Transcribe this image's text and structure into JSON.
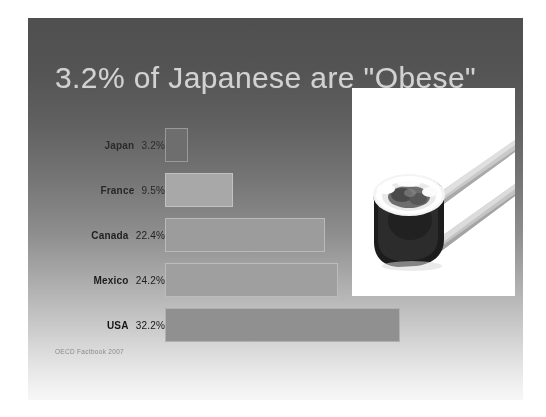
{
  "slide": {
    "title": "3.2% of Japanese are \"Obese\"",
    "source_note": "OECD Factbook 2007",
    "title_color": "#d2d2d2",
    "background_top_color": "#4f4f4f",
    "background_bottom_color": "#f7f7f7"
  },
  "photo": {
    "alt_name": "sushi-roll-chopsticks-photo",
    "background_color": "#ffffff"
  },
  "chart_data": {
    "type": "bar",
    "orientation": "horizontal",
    "title": "3.2% of Japanese are \"Obese\"",
    "xlabel": "",
    "ylabel": "",
    "categories": [
      "Japan",
      "France",
      "Canada",
      "Mexico",
      "USA"
    ],
    "values": [
      3.2,
      9.5,
      22.4,
      24.2,
      32.2
    ],
    "value_labels": [
      "3.2%",
      "9.5%",
      "22.4%",
      "24.2%",
      "32.2%"
    ],
    "unit": "%",
    "xlim": [
      0,
      32.2
    ],
    "grid": false,
    "legend": false,
    "source": "OECD Factbook 2007",
    "bar_colors": [
      "#6e6e6e",
      "#a6a6a6",
      "#9a9a9a",
      "#9e9e9e",
      "#8f8f8f"
    ],
    "label_colors": [
      "#2a2a2a",
      "#2a2a2a",
      "#1f1f1f",
      "#1f1f1f",
      "#1a1a1a"
    ]
  },
  "rows": [
    {
      "country": "Japan",
      "value_label": "3.2%",
      "top": 110,
      "width": 23,
      "bar_color": "#6e6e6e",
      "label_color": "#2b2b2b"
    },
    {
      "country": "France",
      "value_label": "9.5%",
      "top": 155,
      "width": 68,
      "bar_color": "#a8a8a8",
      "label_color": "#272727"
    },
    {
      "country": "Canada",
      "value_label": "22.4%",
      "top": 200,
      "width": 160,
      "bar_color": "#9c9c9c",
      "label_color": "#1f1f1f"
    },
    {
      "country": "Mexico",
      "value_label": "24.2%",
      "top": 245,
      "width": 173,
      "bar_color": "#9f9f9f",
      "label_color": "#1c1c1c"
    },
    {
      "country": "USA",
      "value_label": "32.2%",
      "top": 290,
      "width": 235,
      "bar_color": "#909090",
      "label_color": "#161616"
    }
  ]
}
